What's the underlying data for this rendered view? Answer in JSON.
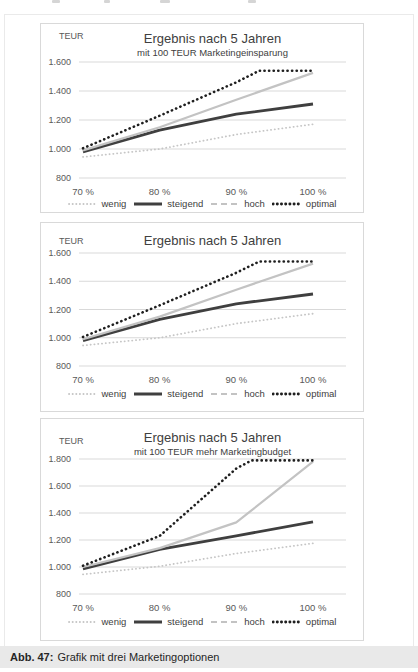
{
  "caption": {
    "label": "Abb. 47:",
    "text": "Grafik mit drei Marketingoptionen"
  },
  "colors": {
    "wenig": "#c6c6c6",
    "steigend": "#3f3f3f",
    "hoch": "#c3c3c3",
    "optimal": "#1f1f1f",
    "gridline": "#d9d9d9",
    "tick_text": "#595959",
    "title_text": "#404040",
    "chart_border": "#d9d9d9",
    "caption_bg": "#e9e9e9"
  },
  "chart_data": [
    {
      "type": "line",
      "title": "Ergebnis nach 5 Jahren",
      "subtitle": "mit 100 TEUR Marketingeinsparung",
      "unit_label": "TEUR",
      "categories": [
        "70 %",
        "80 %",
        "90 %",
        "100 %"
      ],
      "y_ticks": [
        "1.600",
        "1.400",
        "1.200",
        "1.000",
        "800"
      ],
      "ylim": [
        800,
        1600
      ],
      "grid": true,
      "legend_position": "bottom",
      "series": [
        {
          "name": "wenig",
          "color": "#c6c6c6",
          "line_style": "dotted",
          "values": [
            945,
            1000,
            1100,
            1170
          ],
          "points": [
            [
              0,
              945
            ],
            [
              1,
              1000
            ],
            [
              2,
              1100
            ],
            [
              3,
              1170
            ]
          ]
        },
        {
          "name": "steigend",
          "color": "#3f3f3f",
          "line_style": "solid",
          "values": [
            980,
            1130,
            1240,
            1310
          ],
          "points": [
            [
              0,
              980
            ],
            [
              1,
              1130
            ],
            [
              2,
              1240
            ],
            [
              3,
              1310
            ]
          ]
        },
        {
          "name": "hoch",
          "color": "#c3c3c3",
          "line_style": "dashed",
          "values": [
            990,
            1150,
            1340,
            1525
          ],
          "points": [
            [
              0,
              990
            ],
            [
              1,
              1150
            ],
            [
              2,
              1340
            ],
            [
              3,
              1525
            ]
          ]
        },
        {
          "name": "optimal",
          "color": "#1f1f1f",
          "line_style": "dotted-bold",
          "values": [
            1005,
            1230,
            1460,
            1540
          ],
          "points": [
            [
              0,
              1005
            ],
            [
              1,
              1230
            ],
            [
              2,
              1460
            ],
            [
              2.3,
              1540
            ],
            [
              3,
              1540
            ]
          ]
        }
      ]
    },
    {
      "type": "line",
      "title": "Ergebnis nach 5 Jahren",
      "unit_label": "TEUR",
      "categories": [
        "70 %",
        "80 %",
        "90 %",
        "100 %"
      ],
      "y_ticks": [
        "1.600",
        "1.400",
        "1.200",
        "1.000",
        "800"
      ],
      "ylim": [
        800,
        1600
      ],
      "grid": true,
      "legend_position": "bottom",
      "series": [
        {
          "name": "wenig",
          "color": "#c6c6c6",
          "line_style": "dotted",
          "values": [
            945,
            1000,
            1100,
            1170
          ],
          "points": [
            [
              0,
              945
            ],
            [
              1,
              1000
            ],
            [
              2,
              1100
            ],
            [
              3,
              1170
            ]
          ]
        },
        {
          "name": "steigend",
          "color": "#3f3f3f",
          "line_style": "solid",
          "values": [
            980,
            1130,
            1240,
            1310
          ],
          "points": [
            [
              0,
              980
            ],
            [
              1,
              1130
            ],
            [
              2,
              1240
            ],
            [
              3,
              1310
            ]
          ]
        },
        {
          "name": "hoch",
          "color": "#c3c3c3",
          "line_style": "dashed",
          "values": [
            990,
            1150,
            1340,
            1525
          ],
          "points": [
            [
              0,
              990
            ],
            [
              1,
              1150
            ],
            [
              2,
              1340
            ],
            [
              3,
              1525
            ]
          ]
        },
        {
          "name": "optimal",
          "color": "#1f1f1f",
          "line_style": "dotted-bold",
          "values": [
            1005,
            1230,
            1460,
            1540
          ],
          "points": [
            [
              0,
              1005
            ],
            [
              1,
              1230
            ],
            [
              2,
              1460
            ],
            [
              2.3,
              1540
            ],
            [
              3,
              1540
            ]
          ]
        }
      ]
    },
    {
      "type": "line",
      "title": "Ergebnis nach 5 Jahren",
      "subtitle": "mit 100 TEUR mehr Marketingbudget",
      "unit_label": "TEUR",
      "categories": [
        "70 %",
        "80 %",
        "90 %",
        "100 %"
      ],
      "y_ticks": [
        "1.800",
        "1.600",
        "1.400",
        "1.200",
        "1.000",
        "800"
      ],
      "ylim": [
        800,
        1800
      ],
      "grid": true,
      "legend_position": "bottom",
      "series": [
        {
          "name": "wenig",
          "color": "#c6c6c6",
          "line_style": "dotted",
          "values": [
            945,
            1005,
            1100,
            1175
          ],
          "points": [
            [
              0,
              945
            ],
            [
              1,
              1005
            ],
            [
              2,
              1100
            ],
            [
              3,
              1175
            ]
          ]
        },
        {
          "name": "steigend",
          "color": "#3f3f3f",
          "line_style": "solid",
          "values": [
            985,
            1130,
            1230,
            1335
          ],
          "points": [
            [
              0,
              985
            ],
            [
              1,
              1130
            ],
            [
              2,
              1230
            ],
            [
              3,
              1335
            ]
          ]
        },
        {
          "name": "hoch",
          "color": "#c3c3c3",
          "line_style": "dashed",
          "values": [
            1000,
            1140,
            1330,
            1780
          ],
          "points": [
            [
              0,
              1000
            ],
            [
              1,
              1140
            ],
            [
              2,
              1330
            ],
            [
              3,
              1780
            ]
          ]
        },
        {
          "name": "optimal",
          "color": "#1f1f1f",
          "line_style": "dotted-bold",
          "values": [
            1010,
            1230,
            1730,
            1790
          ],
          "points": [
            [
              0,
              1010
            ],
            [
              1,
              1230
            ],
            [
              2,
              1730
            ],
            [
              2.2,
              1790
            ],
            [
              3,
              1790
            ]
          ]
        }
      ]
    }
  ]
}
